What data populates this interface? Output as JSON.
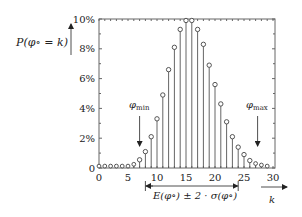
{
  "chart_data": {
    "type": "stem",
    "title": "",
    "xlabel": "k",
    "ylabel": "P(φ∘ = k)",
    "xlim": [
      0,
      30
    ],
    "ylim": [
      0,
      10
    ],
    "y_unit": "%",
    "xticks": [
      0,
      5,
      10,
      15,
      20,
      25,
      30
    ],
    "xtick_labels": [
      "0",
      "5",
      "10",
      "15",
      "20",
      "25",
      "30"
    ],
    "yticks": [
      0,
      2,
      4,
      6,
      8,
      10
    ],
    "ytick_labels": [
      "0",
      "2%",
      "4%",
      "6%",
      "8%",
      "10%"
    ],
    "grid": false,
    "x": [
      0,
      1,
      2,
      3,
      4,
      5,
      6,
      7,
      8,
      9,
      10,
      11,
      12,
      13,
      14,
      15,
      16,
      17,
      18,
      19,
      20,
      21,
      22,
      23,
      24,
      25,
      26,
      27,
      28,
      29
    ],
    "values": [
      0.0,
      0.0,
      0.0,
      0.0,
      0.02,
      0.1,
      0.25,
      0.55,
      1.1,
      2.1,
      3.3,
      4.9,
      6.6,
      8.1,
      9.3,
      9.9,
      9.9,
      9.3,
      8.3,
      6.9,
      5.6,
      4.3,
      3.1,
      2.1,
      1.4,
      0.9,
      0.5,
      0.3,
      0.2,
      0.1
    ],
    "annotations": [
      {
        "label": "φmin",
        "x": 7,
        "type": "arrow-down"
      },
      {
        "label": "φmax",
        "x": 27,
        "type": "arrow-down"
      },
      {
        "label": "E(φ∘) ± 2 · σ(φ∘)",
        "x_start": 8,
        "x_end": 24,
        "type": "range-bracket"
      }
    ]
  },
  "labels": {
    "ylabel": "P(φ∘ = k)",
    "xlabel": "k",
    "phi_min": "φ",
    "phi_min_sub": "min",
    "phi_max": "φ",
    "phi_max_sub": "max",
    "range": "E(φ∘) ± 2 · σ(φ∘)"
  }
}
